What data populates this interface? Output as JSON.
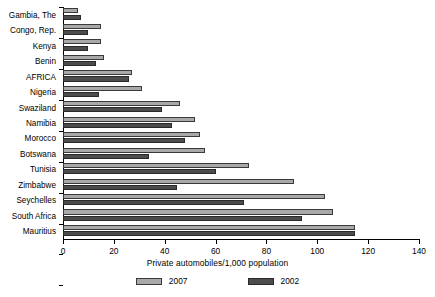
{
  "chart_data": {
    "type": "bar",
    "orientation": "horizontal",
    "title": "",
    "xlabel": "Private automobiles/1,000 population",
    "ylabel": "",
    "xlim": [
      0,
      140
    ],
    "xticks": [
      0,
      20,
      40,
      60,
      80,
      100,
      120,
      140
    ],
    "grid": false,
    "legend_position": "bottom",
    "categories": [
      "Gambia, The",
      "Congo, Rep.",
      "Kenya",
      "Benin",
      "AFRICA",
      "Nigeria",
      "Swaziland",
      "Namibia",
      "Morocco",
      "Botswana",
      "Tunisia",
      "Zimbabwe",
      "Seychelles",
      "South Africa",
      "Mauritius"
    ],
    "series": [
      {
        "name": "2007",
        "color": "#a9a9a9",
        "values": [
          6,
          15,
          15,
          16,
          27,
          31,
          46,
          52,
          54,
          56,
          73,
          91,
          103,
          106,
          115
        ]
      },
      {
        "name": "2002",
        "color": "#4c4c4c",
        "values": [
          7,
          10,
          10,
          13,
          26,
          14,
          39,
          43,
          48,
          34,
          60,
          45,
          71,
          94,
          115
        ]
      }
    ]
  },
  "legend": {
    "items": [
      {
        "label": "2007",
        "swatch": "legend-swatch-2007"
      },
      {
        "label": "2002",
        "swatch": "legend-swatch-2002"
      }
    ]
  }
}
